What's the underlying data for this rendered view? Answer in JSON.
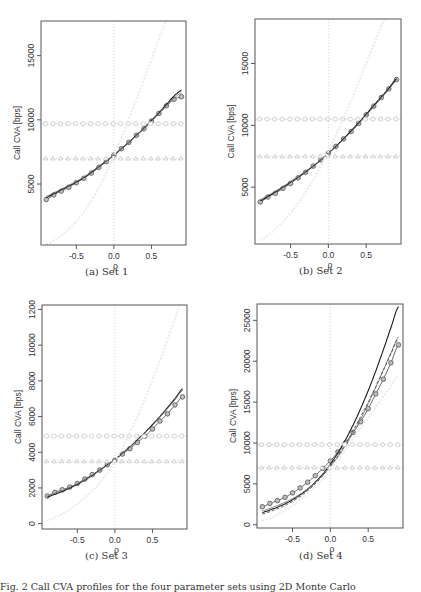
{
  "figure": {
    "bottom_caption": "Fig. 2   Call CVA profiles for the four parameter sets using 2D Monte Carlo"
  },
  "chart_data": [
    {
      "id": "a",
      "caption": "(a) Set 1",
      "type": "line",
      "xlabel": "ρ",
      "ylabel": "Call CVA [bps]",
      "xlim": [
        -0.97,
        0.96
      ],
      "ylim": [
        250,
        17700
      ],
      "xticks": [
        -0.5,
        0.0,
        0.5
      ],
      "xtick_labels": [
        "-0.5",
        "0.0",
        "0.5"
      ],
      "yticks": [
        5000,
        10000,
        15000
      ],
      "ytick_labels": [
        "5000",
        "10000",
        "15000"
      ],
      "grid": false,
      "vline_x": 0,
      "x": [
        -0.9,
        -0.8,
        -0.7,
        -0.6,
        -0.5,
        -0.4,
        -0.3,
        -0.2,
        -0.1,
        0.0,
        0.1,
        0.2,
        0.3,
        0.4,
        0.5,
        0.6,
        0.7,
        0.8,
        0.9
      ],
      "series": [
        {
          "name": "Monte Carlo (circles)",
          "style": "circle-line",
          "values": [
            3800,
            4150,
            4450,
            4750,
            5100,
            5450,
            5850,
            6300,
            6750,
            7250,
            7750,
            8250,
            8800,
            9300,
            9900,
            10500,
            11100,
            11600,
            11800
          ]
        },
        {
          "name": "model A",
          "style": "solid-dark",
          "values": [
            3950,
            4250,
            4550,
            4850,
            5150,
            5500,
            5900,
            6350,
            6800,
            7250,
            7750,
            8250,
            8800,
            9350,
            9950,
            10550,
            11200,
            11850,
            12300
          ]
        },
        {
          "name": "model B",
          "style": "solid-gray",
          "values": [
            4050,
            4320,
            4600,
            4900,
            5200,
            5550,
            5950,
            6380,
            6830,
            7280,
            7760,
            8260,
            8790,
            9330,
            9900,
            10480,
            11080,
            11680,
            12100
          ]
        },
        {
          "name": "constant (diamonds)",
          "style": "diamond-flat",
          "values": [
            9700,
            9700,
            9700,
            9700,
            9700,
            9700,
            9700,
            9700,
            9700,
            9700,
            9700,
            9700,
            9700,
            9700,
            9700,
            9700,
            9700,
            9700,
            9700
          ]
        },
        {
          "name": "constant (triangles)",
          "style": "triangle-flat",
          "values": [
            7000,
            7000,
            7000,
            7000,
            7000,
            7000,
            7000,
            7000,
            7000,
            7000,
            7000,
            7000,
            7000,
            7000,
            7000,
            7000,
            7000,
            7000,
            7000
          ]
        },
        {
          "name": "faint curve",
          "style": "faint",
          "values": [
            300,
            600,
            1000,
            1500,
            2100,
            2800,
            3700,
            4700,
            5900,
            7200,
            8600,
            10100,
            11600,
            13100,
            14700,
            16300,
            17800,
            19300,
            20800
          ]
        }
      ]
    },
    {
      "id": "b",
      "caption": "(b) Set 2",
      "type": "line",
      "xlabel": "ρ",
      "ylabel": "Call CVA [bps]",
      "xlim": [
        -0.97,
        0.96
      ],
      "ylim": [
        400,
        18600
      ],
      "xticks": [
        -0.5,
        0.0,
        0.5
      ],
      "xtick_labels": [
        "-0.5",
        "0.0",
        "0.5"
      ],
      "yticks": [
        5000,
        10000,
        15000
      ],
      "ytick_labels": [
        "5000",
        "10000",
        "15000"
      ],
      "grid": false,
      "vline_x": 0,
      "x": [
        -0.9,
        -0.8,
        -0.7,
        -0.6,
        -0.5,
        -0.4,
        -0.3,
        -0.2,
        -0.1,
        0.0,
        0.1,
        0.2,
        0.3,
        0.4,
        0.5,
        0.6,
        0.7,
        0.8,
        0.9
      ],
      "series": [
        {
          "name": "Monte Carlo (circles)",
          "style": "circle-line",
          "values": [
            3800,
            4200,
            4500,
            4900,
            5300,
            5750,
            6200,
            6700,
            7200,
            7750,
            8300,
            8900,
            9500,
            10150,
            10850,
            11550,
            12250,
            12950,
            13700
          ]
        },
        {
          "name": "model A",
          "style": "solid-dark",
          "values": [
            3900,
            4250,
            4600,
            5000,
            5400,
            5800,
            6250,
            6700,
            7200,
            7750,
            8300,
            8900,
            9550,
            10200,
            10900,
            11600,
            12300,
            13000,
            13750
          ]
        },
        {
          "name": "model B",
          "style": "solid-gray",
          "values": [
            4000,
            4330,
            4680,
            5050,
            5450,
            5850,
            6280,
            6730,
            7220,
            7730,
            8270,
            8850,
            9470,
            10120,
            10800,
            11500,
            12200,
            12900,
            13600
          ]
        },
        {
          "name": "constant (diamonds)",
          "style": "diamond-flat",
          "values": [
            10500,
            10500,
            10500,
            10500,
            10500,
            10500,
            10500,
            10500,
            10500,
            10500,
            10500,
            10500,
            10500,
            10500,
            10500,
            10500,
            10500,
            10500,
            10500
          ]
        },
        {
          "name": "constant (triangles)",
          "style": "triangle-flat",
          "values": [
            7500,
            7500,
            7500,
            7500,
            7500,
            7500,
            7500,
            7500,
            7500,
            7500,
            7500,
            7500,
            7500,
            7500,
            7500,
            7500,
            7500,
            7500,
            7500
          ]
        },
        {
          "name": "faint curve",
          "style": "faint",
          "values": [
            700,
            1100,
            1600,
            2200,
            2900,
            3700,
            4600,
            5600,
            6700,
            7900,
            9200,
            10600,
            12000,
            13500,
            15000,
            16500,
            18000,
            19500,
            21000
          ]
        }
      ]
    },
    {
      "id": "c",
      "caption": "(c) Set 3",
      "type": "line",
      "xlabel": "ρ",
      "ylabel": "Call CVA [bps]",
      "xlim": [
        -0.97,
        0.96
      ],
      "ylim": [
        -300,
        12250
      ],
      "xticks": [
        -0.5,
        0.0,
        0.5
      ],
      "xtick_labels": [
        "-0.5",
        "0.0",
        "0.5"
      ],
      "yticks": [
        0,
        2000,
        4000,
        6000,
        8000,
        10000,
        12000
      ],
      "ytick_labels": [
        "0",
        "2000",
        "4000",
        "6000",
        "8000",
        "10000",
        "1200"
      ],
      "grid": false,
      "vline_x": 0,
      "x": [
        -0.9,
        -0.8,
        -0.7,
        -0.6,
        -0.5,
        -0.4,
        -0.3,
        -0.2,
        -0.1,
        0.0,
        0.1,
        0.2,
        0.3,
        0.4,
        0.5,
        0.6,
        0.7,
        0.8,
        0.9
      ],
      "series": [
        {
          "name": "Monte Carlo (circles)",
          "style": "circle-line",
          "values": [
            1550,
            1750,
            1900,
            2050,
            2250,
            2500,
            2750,
            3000,
            3300,
            3550,
            3900,
            4200,
            4550,
            4900,
            5300,
            5750,
            6150,
            6650,
            7100
          ]
        },
        {
          "name": "model A",
          "style": "solid-dark",
          "values": [
            1500,
            1650,
            1800,
            2000,
            2200,
            2450,
            2700,
            3000,
            3300,
            3600,
            3950,
            4300,
            4700,
            5100,
            5550,
            6000,
            6500,
            7000,
            7550
          ]
        },
        {
          "name": "model B",
          "style": "solid-gray",
          "values": [
            1550,
            1700,
            1860,
            2040,
            2240,
            2470,
            2720,
            2990,
            3280,
            3590,
            3930,
            4290,
            4670,
            5070,
            5500,
            5960,
            6440,
            6940,
            7450
          ]
        },
        {
          "name": "constant (diamonds)",
          "style": "diamond-flat",
          "values": [
            4900,
            4900,
            4900,
            4900,
            4900,
            4900,
            4900,
            4900,
            4900,
            4900,
            4900,
            4900,
            4900,
            4900,
            4900,
            4900,
            4900,
            4900,
            4900
          ]
        },
        {
          "name": "constant (triangles)",
          "style": "triangle-flat",
          "values": [
            3500,
            3500,
            3500,
            3500,
            3500,
            3500,
            3500,
            3500,
            3500,
            3500,
            3500,
            3500,
            3500,
            3500,
            3500,
            3500,
            3500,
            3500,
            3500
          ]
        },
        {
          "name": "faint curve",
          "style": "faint",
          "values": [
            200,
            350,
            550,
            800,
            1100,
            1450,
            1850,
            2300,
            2850,
            3500,
            4250,
            5100,
            6000,
            7000,
            8050,
            9150,
            10300,
            11500,
            12700
          ]
        }
      ]
    },
    {
      "id": "d",
      "caption": "(d) Set 4",
      "type": "line",
      "xlabel": "ρ",
      "ylabel": "Call CVA [bps]",
      "xlim": [
        -0.97,
        0.96
      ],
      "ylim": [
        -400,
        27000
      ],
      "xticks": [
        -0.5,
        0.0,
        0.5
      ],
      "xtick_labels": [
        "-0.5",
        "0.0",
        "0.5"
      ],
      "yticks": [
        0,
        5000,
        10000,
        15000,
        20000,
        25000
      ],
      "ytick_labels": [
        "0",
        "5000",
        "10000",
        "15000",
        "20000",
        "25000"
      ],
      "grid": false,
      "vline_x": 0,
      "x": [
        -0.9,
        -0.8,
        -0.7,
        -0.6,
        -0.5,
        -0.4,
        -0.3,
        -0.2,
        -0.1,
        0.0,
        0.1,
        0.2,
        0.3,
        0.4,
        0.5,
        0.6,
        0.7,
        0.8,
        0.9
      ],
      "series": [
        {
          "name": "Monte Carlo (circles)",
          "style": "circle-line",
          "values": [
            2200,
            2600,
            2950,
            3350,
            3900,
            4500,
            5200,
            6000,
            6900,
            7800,
            8900,
            10000,
            11300,
            12600,
            14200,
            16000,
            17800,
            19800,
            22000
          ]
        },
        {
          "name": "model A",
          "style": "solid-dark",
          "values": [
            1500,
            1800,
            2150,
            2550,
            3050,
            3650,
            4350,
            5200,
            6200,
            7400,
            8800,
            10400,
            12200,
            14200,
            16400,
            18800,
            21400,
            24100,
            26700
          ]
        },
        {
          "name": "model B",
          "style": "solid-gray",
          "values": [
            1700,
            2000,
            2350,
            2750,
            3200,
            3750,
            4400,
            5150,
            6050,
            7100,
            8300,
            9700,
            11200,
            12900,
            14800,
            16800,
            18900,
            21000,
            23000
          ]
        },
        {
          "name": "model C (dashed)",
          "style": "dashed",
          "values": [
            1300,
            1600,
            1950,
            2350,
            2850,
            3450,
            4150,
            5000,
            6000,
            7150,
            8450,
            9900,
            11500,
            13200,
            15000,
            16900,
            18900,
            20900,
            22800
          ]
        },
        {
          "name": "constant (diamonds)",
          "style": "diamond-flat",
          "values": [
            9800,
            9800,
            9800,
            9800,
            9800,
            9800,
            9800,
            9800,
            9800,
            9800,
            9800,
            9800,
            9800,
            9800,
            9800,
            9800,
            9800,
            9800,
            9800
          ]
        },
        {
          "name": "constant (triangles)",
          "style": "triangle-flat",
          "values": [
            7000,
            7000,
            7000,
            7000,
            7000,
            7000,
            7000,
            7000,
            7000,
            7000,
            7000,
            7000,
            7000,
            7000,
            7000,
            7000,
            7000,
            7000,
            7000
          ]
        },
        {
          "name": "faint curve",
          "style": "faint",
          "values": [
            500,
            800,
            1200,
            1700,
            2300,
            3000,
            3800,
            4700,
            5700,
            6800,
            8000,
            9200,
            10500,
            11800,
            13100,
            14400,
            15700,
            17000,
            18300
          ]
        }
      ]
    }
  ],
  "panels_layout": [
    {
      "frame": [
        41,
        21,
        186,
        245
      ],
      "caption_pos": [
        85,
        274
      ]
    },
    {
      "frame": [
        255,
        19,
        401,
        244
      ],
      "caption_pos": [
        299,
        273
      ]
    },
    {
      "frame": [
        42,
        305,
        187,
        529
      ],
      "caption_pos": [
        85,
        558
      ]
    },
    {
      "frame": [
        257,
        304,
        403,
        528
      ],
      "caption_pos": [
        299,
        558
      ]
    }
  ]
}
